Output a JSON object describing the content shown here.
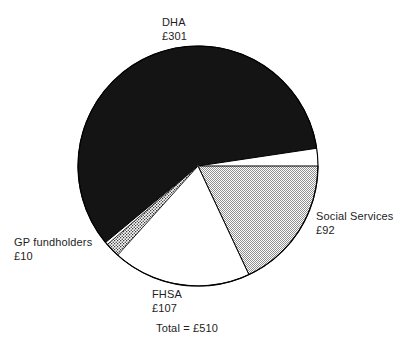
{
  "chart_data": {
    "type": "pie",
    "title": "",
    "subtitle": "",
    "xlabel": "",
    "ylabel": "",
    "currency": "£",
    "total_label": "Total = £510",
    "total_value": 510,
    "legend_position": "outside-labels",
    "grid": false,
    "categories": [
      "DHA",
      "Social Services",
      "FHSA",
      "GP fundholders"
    ],
    "values": [
      301,
      92,
      107,
      10
    ],
    "value_labels": [
      "£301",
      "£92",
      "£107",
      "£10"
    ],
    "start_angle_deg": 0,
    "direction": "clockwise",
    "slices": [
      {
        "name": "DHA",
        "value": 301,
        "value_label": "£301",
        "percent": 59.0,
        "start_deg": 139.0,
        "sweep_deg": 212.5,
        "fill": "#141414",
        "pattern": "solid-black",
        "label_position": "top"
      },
      {
        "name": "Social Services",
        "value": 92,
        "value_label": "£92",
        "percent": 18.0,
        "start_deg": 0.0,
        "sweep_deg": 64.9,
        "fill": "#c9c9c9",
        "pattern": "fine-checker-gray",
        "label_position": "right"
      },
      {
        "name": "FHSA",
        "value": 107,
        "value_label": "£107",
        "percent": 21.0,
        "start_deg": 64.9,
        "sweep_deg": 75.5,
        "fill": "#ffffff",
        "pattern": "solid-white",
        "label_position": "bottom"
      },
      {
        "name": "GP fundholders",
        "value": 10,
        "value_label": "£10",
        "percent": 2.0,
        "start_deg": 132.0,
        "sweep_deg": 7.1,
        "fill": "#e8e8e8",
        "pattern": "coarse-dither",
        "label_position": "left"
      }
    ],
    "geometry": {
      "center_x": 198,
      "center_y": 166,
      "radius": 120,
      "outline_color": "#000000"
    }
  },
  "labels": {
    "dha": {
      "name": "DHA",
      "value": "£301"
    },
    "social_services": {
      "name": "Social Services",
      "value": "£92"
    },
    "fhsa": {
      "name": "FHSA",
      "value": "£107"
    },
    "gp_fundholders": {
      "name": "GP fundholders",
      "value": "£10"
    }
  },
  "footer": {
    "total": "Total = £510"
  }
}
